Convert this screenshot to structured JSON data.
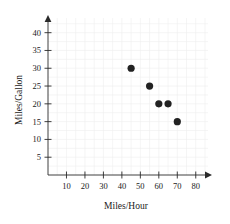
{
  "chart_data": {
    "type": "scatter",
    "title": "",
    "xlabel": "Miles/Hour",
    "ylabel": "Miles/Gallon",
    "xlim": [
      0,
      85
    ],
    "ylim": [
      0,
      43
    ],
    "grid": true,
    "legend": "none",
    "x_ticks": [
      10,
      20,
      30,
      40,
      50,
      60,
      70,
      80
    ],
    "y_ticks": [
      5,
      10,
      15,
      20,
      25,
      30,
      35,
      40
    ],
    "x": [
      45,
      55,
      60,
      65,
      70
    ],
    "y": [
      30,
      25,
      20,
      20,
      15
    ],
    "points": [
      {
        "x": 45,
        "y": 30
      },
      {
        "x": 55,
        "y": 25
      },
      {
        "x": 60,
        "y": 20
      },
      {
        "x": 65,
        "y": 20
      },
      {
        "x": 70,
        "y": 15
      }
    ],
    "marker": "filled-circle",
    "marker_color": "#222222"
  },
  "axes": {
    "x_tick_labels": [
      "10",
      "20",
      "30",
      "40",
      "50",
      "60",
      "70",
      "80"
    ],
    "y_tick_labels": [
      "5",
      "10",
      "15",
      "20",
      "25",
      "30",
      "35",
      "40"
    ],
    "x_axis_title": "Miles/Hour",
    "y_axis_title": "Miles/Gallon"
  },
  "colors": {
    "point": "#222222",
    "axis": "#2a2a2a",
    "grid": "#efefef",
    "background": "#ffffff"
  }
}
